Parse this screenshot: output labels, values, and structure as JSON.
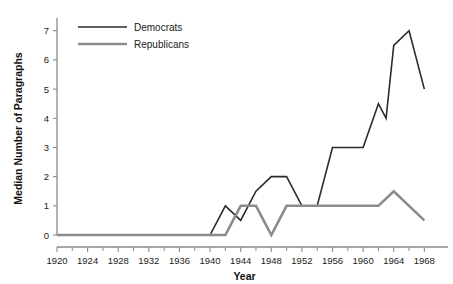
{
  "chart_data": {
    "type": "line",
    "title": "",
    "xlabel": "Year",
    "ylabel": "Median Number of Paragraphs",
    "xlim": [
      1920,
      1969
    ],
    "ylim": [
      0,
      7.3
    ],
    "grid": false,
    "legend_position": "top-left",
    "xticks": [
      1920,
      1924,
      1928,
      1932,
      1936,
      1940,
      1944,
      1948,
      1952,
      1956,
      1960,
      1964,
      1968
    ],
    "xtick_labels": [
      "1920",
      "1924",
      "1928",
      "1932",
      "1936",
      "1940",
      "1944",
      "1948",
      "1952",
      "1956",
      "1960",
      "1964",
      "1968"
    ],
    "xminor_ticks": [
      1922,
      1926,
      1930,
      1934,
      1938,
      1942,
      1946,
      1950,
      1954,
      1958,
      1962,
      1966
    ],
    "yticks": [
      0,
      1,
      2,
      3,
      4,
      5,
      6,
      7
    ],
    "ytick_labels": [
      "0",
      "1",
      "2",
      "3",
      "4",
      "5",
      "6",
      "7"
    ],
    "series": [
      {
        "name": "Democrats",
        "color": "#2b2b2b",
        "width": 1.6,
        "x": [
          1920,
          1924,
          1928,
          1932,
          1936,
          1940,
          1942,
          1944,
          1946,
          1948,
          1950,
          1952,
          1954,
          1956,
          1958,
          1960,
          1962,
          1963,
          1964,
          1966,
          1968
        ],
        "values": [
          0,
          0,
          0,
          0,
          0,
          0,
          1,
          0.5,
          1.5,
          2,
          2,
          1,
          1,
          3,
          3,
          3,
          4.5,
          4,
          6.5,
          7,
          5
        ]
      },
      {
        "name": "Republicans",
        "color": "#8c8c8c",
        "width": 2.6,
        "x": [
          1920,
          1924,
          1928,
          1932,
          1936,
          1940,
          1942,
          1944,
          1946,
          1948,
          1950,
          1952,
          1954,
          1956,
          1958,
          1960,
          1962,
          1964,
          1966,
          1968
        ],
        "values": [
          0,
          0,
          0,
          0,
          0,
          0,
          0,
          1,
          1,
          0,
          1,
          1,
          1,
          1,
          1,
          1,
          1,
          1.5,
          1,
          0.5
        ]
      }
    ]
  },
  "legend": {
    "items": [
      {
        "label": "Democrats",
        "color": "#2b2b2b"
      },
      {
        "label": "Republicans",
        "color": "#8c8c8c"
      }
    ]
  },
  "axes": {
    "x_title": "Year",
    "y_title": "Median Number of Paragraphs",
    "axis_color": "#8a8a8a"
  }
}
